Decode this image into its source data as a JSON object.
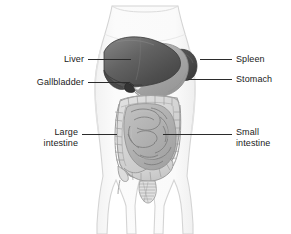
{
  "figure": {
    "background_color": "#ffffff",
    "width": 291,
    "height": 234
  },
  "palette": {
    "body_outline": "#d8d8d8",
    "body_fill": "#f7f7f7",
    "liver": "#5f5f5f",
    "liver_dark": "#474747",
    "liver_light": "#8a8a8a",
    "gallbladder": "#3b3b3b",
    "stomach": "#a9a9a9",
    "stomach_light": "#c4c4c4",
    "spleen": "#4a4a4a",
    "large_intestine": "#d2d2d2",
    "large_intestine_line": "#8c8c8c",
    "small_intestine": "#b0b0b0",
    "small_intestine_line": "#7d7d7d",
    "leader_line": "#2b2b2b",
    "label_text": "#1a1a1a"
  },
  "labels": [
    {
      "id": "liver",
      "text": "Liver",
      "side": "left",
      "lines": [
        "Liver"
      ],
      "text_x": 84,
      "text_y": 54,
      "leader": {
        "x1": 88,
        "y1": 59,
        "x2": 131,
        "y2": 59
      }
    },
    {
      "id": "gallbladder",
      "text": "Gallbladder",
      "side": "left",
      "lines": [
        "Gallbladder"
      ],
      "text_x": 84,
      "text_y": 77,
      "leader": {
        "x1": 88,
        "y1": 82,
        "x2": 129,
        "y2": 82
      }
    },
    {
      "id": "spleen",
      "text": "Spleen",
      "side": "right",
      "lines": [
        "Spleen"
      ],
      "text_x": 236,
      "text_y": 55,
      "leader": {
        "x1": 200,
        "y1": 59,
        "x2": 232,
        "y2": 59
      }
    },
    {
      "id": "stomach",
      "text": "Stomach",
      "side": "right",
      "lines": [
        "Stomach"
      ],
      "text_x": 236,
      "text_y": 74,
      "leader": {
        "x1": 188,
        "y1": 79,
        "x2": 232,
        "y2": 79
      }
    },
    {
      "id": "large-intestine",
      "text": "Large intestine",
      "side": "left",
      "lines": [
        "Large",
        "intestine"
      ],
      "text_x": 78,
      "text_y": 128,
      "leader": {
        "x1": 82,
        "y1": 134,
        "x2": 117,
        "y2": 134
      }
    },
    {
      "id": "small-intestine",
      "text": "Small intestine",
      "side": "right",
      "lines": [
        "Small",
        "intestine"
      ],
      "text_x": 236,
      "text_y": 128,
      "leader": {
        "x1": 163,
        "y1": 134,
        "x2": 232,
        "y2": 134
      }
    }
  ],
  "organs": [
    {
      "id": "liver",
      "name": "Liver"
    },
    {
      "id": "gallbladder",
      "name": "Gallbladder"
    },
    {
      "id": "stomach",
      "name": "Stomach"
    },
    {
      "id": "spleen",
      "name": "Spleen"
    },
    {
      "id": "large-intestine",
      "name": "Large intestine"
    },
    {
      "id": "small-intestine",
      "name": "Small intestine"
    },
    {
      "id": "torso",
      "name": "Torso outline"
    }
  ]
}
